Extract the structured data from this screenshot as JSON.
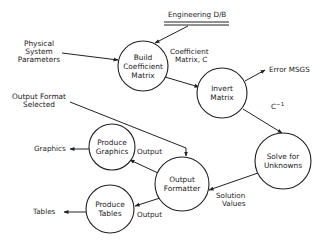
{
  "diagram": {
    "type": "data-flow-diagram",
    "data_store": {
      "label": "Engineering D/B"
    },
    "processes": [
      {
        "id": "build",
        "lines": [
          "Build",
          "Coefficient",
          "Matrix"
        ]
      },
      {
        "id": "invert",
        "lines": [
          "Invert",
          "Matrix"
        ]
      },
      {
        "id": "solve",
        "lines": [
          "Solve for",
          "Unknowns"
        ]
      },
      {
        "id": "formatter",
        "lines": [
          "Output",
          "Formatter"
        ]
      },
      {
        "id": "graphics",
        "lines": [
          "Produce",
          "Graphics"
        ]
      },
      {
        "id": "tables",
        "lines": [
          "Produce",
          "Tables"
        ]
      }
    ],
    "external_inputs": {
      "physical": [
        "Physical",
        "System",
        "Parameters"
      ],
      "format": [
        "Output Format",
        "Selected"
      ]
    },
    "flow_labels": {
      "coef": [
        "Coefficient",
        "Matrix, C"
      ],
      "error": "Error MSGS",
      "cinv": "C",
      "cinv_sup": "−1",
      "solution": [
        "Solution",
        "Values"
      ],
      "output_graphics": "Output",
      "output_tables": "Output",
      "graphics_out": "Graphics",
      "tables_out": "Tables"
    },
    "colors": {
      "stroke": "#222222",
      "background": "#ffffff",
      "text": "#1a1a1a"
    }
  }
}
